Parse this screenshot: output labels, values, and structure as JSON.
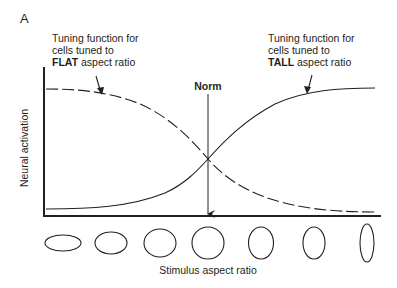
{
  "figure": {
    "panel_letter": "A",
    "y_axis_label": "Neural activation",
    "x_axis_label": "Stimulus aspect ratio",
    "norm_label": "Norm",
    "annotations": {
      "flat": {
        "line1": "Tuning function for",
        "line2": "cells tuned to",
        "bold": "FLAT",
        "rest": " aspect ratio"
      },
      "tall": {
        "line1": "Tuning function for",
        "line2": "cells tuned to",
        "bold": "TALL",
        "rest": " aspect ratio"
      }
    },
    "curves": [
      {
        "name": "FLAT tuning function",
        "style": "dashed",
        "trend": "decreasing sigmoid"
      },
      {
        "name": "TALL tuning function",
        "style": "solid",
        "trend": "increasing sigmoid"
      }
    ],
    "stimuli": [
      {
        "index": 1,
        "shape": "wide ellipse",
        "rx": 18,
        "ry": 8
      },
      {
        "index": 2,
        "shape": "flat ellipse",
        "rx": 16,
        "ry": 11
      },
      {
        "index": 3,
        "shape": "slightly flat ellipse",
        "rx": 16,
        "ry": 14
      },
      {
        "index": 4,
        "shape": "circle",
        "rx": 16,
        "ry": 16
      },
      {
        "index": 5,
        "shape": "slightly tall ellipse",
        "rx": 13,
        "ry": 16
      },
      {
        "index": 6,
        "shape": "tall ellipse",
        "rx": 11,
        "ry": 16
      },
      {
        "index": 7,
        "shape": "narrow tall ellipse",
        "rx": 7,
        "ry": 18
      }
    ],
    "colors": {
      "ink": "#231f20",
      "background": "#ffffff"
    }
  }
}
